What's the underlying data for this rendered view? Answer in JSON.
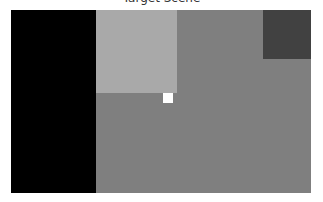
{
  "title": "Target Scene",
  "scene": {
    "background": "#7f7f7f",
    "regions": [
      {
        "name": "black-region",
        "x": 0,
        "y": 0,
        "w": 85,
        "h": 183,
        "color": "#000000"
      },
      {
        "name": "light-gray-region",
        "x": 85,
        "y": 0,
        "w": 81,
        "h": 83,
        "color": "#a9a9a9"
      },
      {
        "name": "dark-gray-region",
        "x": 252,
        "y": 0,
        "w": 48,
        "h": 49,
        "color": "#414141"
      },
      {
        "name": "white-square",
        "x": 152,
        "y": 83,
        "w": 10,
        "h": 10,
        "color": "#ffffff"
      }
    ]
  }
}
